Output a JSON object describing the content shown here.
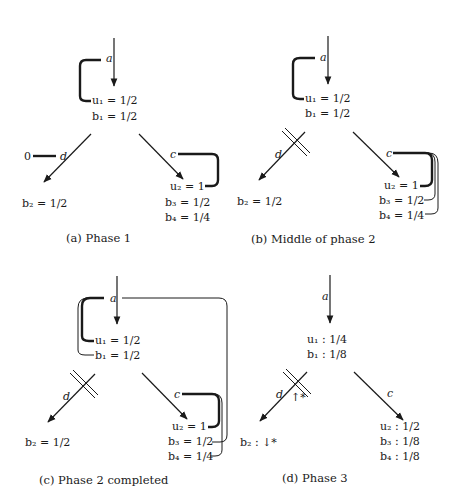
{
  "panels": [
    {
      "id": "a",
      "caption": "(a) Phase 1",
      "edges": {
        "top": "a",
        "left": "d",
        "right": "c"
      },
      "node1": [
        "u₁ = 1/2",
        "b₁ = 1/2"
      ],
      "node_left": [
        "b₂ = 1/2"
      ],
      "node_right": [
        "u₂ = 1",
        "b₃ = 1/2",
        "b₄ = 1/4"
      ],
      "left_marker": "0"
    },
    {
      "id": "b",
      "caption": "(b) Middle of phase 2",
      "edges": {
        "top": "a",
        "left": "d",
        "right": "c"
      },
      "node1": [
        "u₁ = 1/2",
        "b₁ = 1/2"
      ],
      "node_left": [
        "b₂ = 1/2"
      ],
      "node_right": [
        "u₂ = 1",
        "b₃ = 1/2",
        "b₄ = 1/4"
      ]
    },
    {
      "id": "c",
      "caption": "(c) Phase 2 completed",
      "edges": {
        "top": "a",
        "left": "d",
        "right": "c"
      },
      "node1": [
        "u₁ = 1/2",
        "b₁ = 1/2"
      ],
      "node_left": [
        "b₂ = 1/2"
      ],
      "node_right": [
        "u₂ = 1",
        "b₃ = 1/2",
        "b₄ = 1/4"
      ]
    },
    {
      "id": "d",
      "caption": "(d) Phase 3",
      "edges": {
        "top": "a",
        "left": "d",
        "right": "c"
      },
      "node1": [
        "u₁ :  1/4",
        "b₁ :  1/8"
      ],
      "node_left": [
        "b₂ :  ↓*"
      ],
      "node_right": [
        "u₂ :  1/2",
        "b₃ :  1/8",
        "b₄ :  1/8"
      ],
      "cut_annotation": "↑*"
    }
  ]
}
